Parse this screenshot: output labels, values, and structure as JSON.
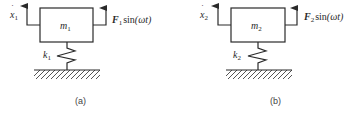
{
  "figure": {
    "panels": [
      {
        "id": "a",
        "caption": "(a)",
        "mass_label": {
          "base": "m",
          "sub": "1"
        },
        "velocity_label": {
          "base": "x",
          "dot": "˙",
          "sub": "1"
        },
        "force_label": {
          "base": "F",
          "sub": "1",
          "func": "sin",
          "arg": "(ωt)"
        },
        "spring_label": {
          "base": "k",
          "sub": "1"
        }
      },
      {
        "id": "b",
        "caption": "(b)",
        "mass_label": {
          "base": "m",
          "sub": "2"
        },
        "velocity_label": {
          "base": "x",
          "dot": "˙",
          "sub": "2"
        },
        "force_label": {
          "base": "F",
          "sub": "2",
          "func": "sin",
          "arg": "(ωt)"
        },
        "spring_label": {
          "base": "k",
          "sub": "2"
        }
      }
    ],
    "colors": {
      "line": "#2a2a2a",
      "background": "#ffffff"
    }
  }
}
